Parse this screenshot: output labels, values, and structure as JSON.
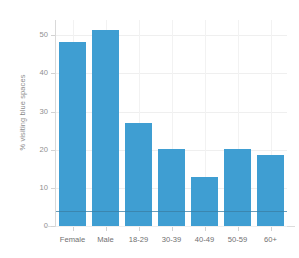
{
  "chart_data": {
    "type": "bar",
    "title": "",
    "subtitle": "",
    "xlabel": "",
    "ylabel": "% visiting blue spaces",
    "categories": [
      "Female",
      "Male",
      "18-29",
      "30-39",
      "40-49",
      "50-59",
      "60+"
    ],
    "values": [
      48.2,
      51.5,
      27.0,
      20.3,
      12.8,
      20.2,
      18.5
    ],
    "ylim": [
      0,
      54
    ],
    "yticks": [
      0,
      10,
      20,
      30,
      40,
      50
    ],
    "ytick_labels": [
      "0",
      "10",
      "20",
      "30",
      "40",
      "50"
    ],
    "grid": true,
    "grid_axis": "both",
    "legend": "none",
    "bar_color": "#3f9ed2",
    "background_color": "#ffffff",
    "gridline_color": "#efefef",
    "axis_color": "#d9d9d9",
    "tick_label_color": "#8f8f8f",
    "annotations": [
      {
        "name": "reference-line",
        "type": "horizontal-line",
        "value": 3.9,
        "color": "#3b7ea3"
      }
    ]
  }
}
